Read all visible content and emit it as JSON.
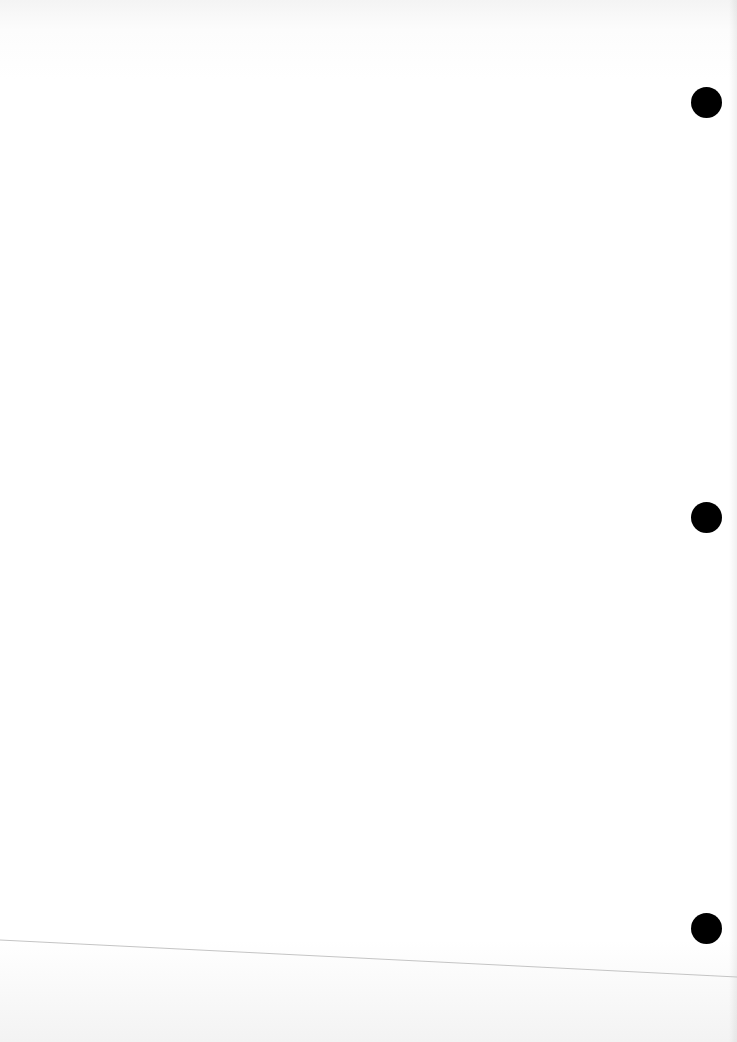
{
  "document": {
    "type": "blank scanned page",
    "text": "",
    "punch_holes": [
      {
        "cx": 706,
        "cy": 102
      },
      {
        "cx": 706,
        "cy": 517
      },
      {
        "cx": 706,
        "cy": 928
      }
    ],
    "rule_line": {
      "x1": 0,
      "y1": 940,
      "x2": 737,
      "y2": 977,
      "color": "#bdbdbd"
    },
    "colors": {
      "paper": "#ffffff",
      "hole": "#000000"
    }
  }
}
